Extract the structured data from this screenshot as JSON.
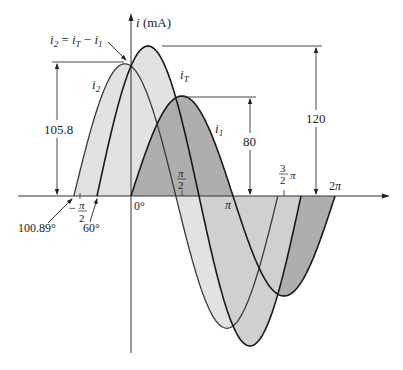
{
  "figure": {
    "y_axis_label": "i (mA)",
    "y_axis_label_var": "i",
    "y_axis_label_unit": " (mA)",
    "annotation_formula": "i₂ = i_T − i₁",
    "curve_labels": {
      "i2": "i₂",
      "iT": "i_T",
      "i1": "i₁"
    },
    "dimensions": {
      "i2_peak": "105.8",
      "i1_peak": "80",
      "iT_peak": "120"
    },
    "x_tick_labels": {
      "neg_pi_over_2": "−π/2",
      "zero": "0°",
      "pi_over_2": "π/2",
      "pi": "π",
      "three_pi_over_2": "3/2 π",
      "two_pi": "2π"
    },
    "phase_labels": {
      "i2_start": "100.89°",
      "iT_start": "60°"
    },
    "colors": {
      "light_fill": "#e2e2e2",
      "dark_fill": "#aeaeae",
      "curve_stroke": "#1a1a1a",
      "axis_stroke": "#333333"
    }
  },
  "chart_data": {
    "type": "line",
    "title": "",
    "xlabel": "θ",
    "ylabel": "i (mA)",
    "x_ticks": [
      "−π/2",
      "0°",
      "π/2",
      "π",
      "3π/2",
      "2π"
    ],
    "series": [
      {
        "name": "i_T",
        "amplitude": 120,
        "phase_deg": 60,
        "expression": "120 sin(θ + 60°)"
      },
      {
        "name": "i_1",
        "amplitude": 80,
        "phase_deg": 0,
        "expression": "80 sin(θ)"
      },
      {
        "name": "i_2",
        "amplitude": 105.8,
        "phase_deg": 100.89,
        "expression": "105.8 sin(θ + 100.89°)"
      }
    ],
    "annotations": [
      "i₂ = i_T − i₁",
      "105.8",
      "80",
      "120",
      "100.89°",
      "60°"
    ],
    "grid": false
  }
}
